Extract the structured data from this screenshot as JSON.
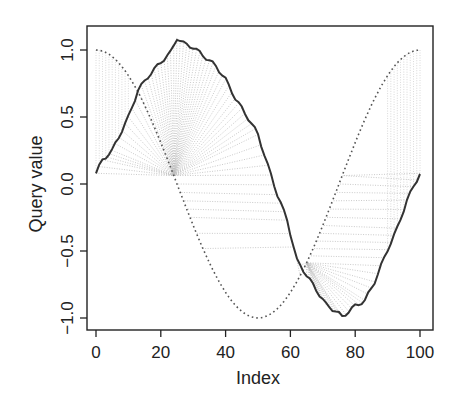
{
  "chart_data": {
    "type": "line",
    "title": "",
    "xlabel": "Index",
    "ylabel": "Query value",
    "xlim": [
      0,
      100
    ],
    "ylim": [
      -1.1,
      1.2
    ],
    "x_ticks": [
      0,
      20,
      40,
      60,
      80,
      100
    ],
    "x_tick_labels": [
      "0",
      "20",
      "40",
      "60",
      "80",
      "100"
    ],
    "y_ticks": [
      -1.0,
      -0.5,
      0.0,
      0.5,
      1.0
    ],
    "y_tick_labels": [
      "−1.0",
      "−0.5",
      "0.0",
      "0.5",
      "1.0"
    ],
    "grid": false,
    "legend": null,
    "series": [
      {
        "name": "query",
        "style": "solid",
        "color": "#333333",
        "x": [
          0,
          2,
          5,
          10,
          13,
          16,
          20,
          23,
          25,
          27,
          30,
          33,
          37,
          40,
          43,
          47,
          50,
          53,
          56,
          59,
          62,
          65,
          68,
          71,
          74,
          76,
          80,
          83,
          86,
          90,
          93,
          96,
          100
        ],
        "values": [
          0.08,
          0.18,
          0.25,
          0.5,
          0.7,
          0.8,
          0.91,
          0.98,
          1.09,
          1.05,
          1.02,
          0.96,
          0.88,
          0.78,
          0.64,
          0.49,
          0.37,
          0.14,
          -0.08,
          -0.27,
          -0.57,
          -0.68,
          -0.79,
          -0.9,
          -0.95,
          -0.99,
          -0.91,
          -0.87,
          -0.73,
          -0.49,
          -0.33,
          -0.12,
          0.08
        ]
      },
      {
        "name": "reference",
        "style": "dotted",
        "color": "#555555",
        "formula": "cos(2*pi*x/100)",
        "x_range": [
          0,
          100
        ]
      },
      {
        "name": "alignment",
        "style": "dotted-connectors",
        "color": "#bbbbbb",
        "description": "DTW warping path lines connecting query to reference"
      }
    ]
  }
}
